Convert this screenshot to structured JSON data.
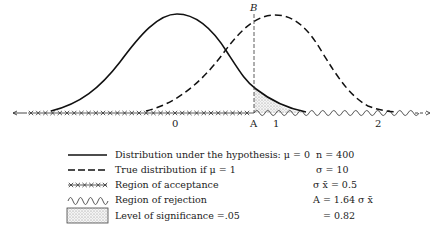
{
  "diagram": {
    "type": "hypothesis-test-distributions",
    "point_labels": {
      "B": "B",
      "A": "A"
    },
    "axis_ticks": [
      {
        "label": "0",
        "x": 175
      },
      {
        "label": "A",
        "x": 254
      },
      {
        "label": "1",
        "x": 276
      },
      {
        "label": "2",
        "x": 378
      }
    ],
    "curves": [
      {
        "name": "Distribution under the hypothesis",
        "mean": 0,
        "style": "solid"
      },
      {
        "name": "True distribution if mu = 1",
        "mean": 1,
        "style": "dashed"
      }
    ],
    "critical_value_A": 0.82,
    "shaded_region": "Level of significance = .05"
  },
  "legend": {
    "items": [
      {
        "symbol": "solid-line",
        "text": "Distribution under the hypothesis: μ = 0"
      },
      {
        "symbol": "dashed-line",
        "text": "True distribution if  μ = 1"
      },
      {
        "symbol": "cross-line",
        "text": "Region of acceptance"
      },
      {
        "symbol": "wave-line",
        "text": "Region of rejection"
      },
      {
        "symbol": "dotted-box",
        "text": "Level of significance =.05"
      }
    ]
  },
  "parameters": {
    "n": "n = 400",
    "sigma": "σ = 10",
    "sigma_xbar": "σ x̄ = 0.5",
    "A_formula": "A = 1.64 σ x̄",
    "A_value": "= 0.82"
  }
}
